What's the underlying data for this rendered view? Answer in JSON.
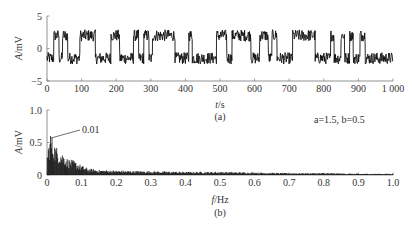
{
  "chart_data": [
    {
      "id": "a",
      "type": "line",
      "panel_label": "(a)",
      "title": "",
      "xlabel_var": "t",
      "xlabel_unit": "/s",
      "ylabel_var": "A",
      "ylabel_unit": "/mV",
      "xlim": [
        0,
        1000
      ],
      "ylim": [
        -5,
        5
      ],
      "xticks": [
        0,
        100,
        200,
        300,
        400,
        500,
        600,
        700,
        800,
        900,
        1000
      ],
      "xtick_labels": [
        "0",
        "100",
        "200",
        "300",
        "400",
        "500",
        "600",
        "700",
        "800",
        "900",
        "1 000"
      ],
      "yticks": [
        -5,
        0,
        5
      ],
      "ytick_labels": [
        "−5",
        "0",
        "5"
      ],
      "grid": false,
      "description": "Noisy two-state switching signal between about +2 mV and −1.5 mV",
      "high_level": 2.0,
      "low_level": -1.5,
      "state_segments": [
        {
          "start": 0,
          "end": 20,
          "level": "low"
        },
        {
          "start": 20,
          "end": 35,
          "level": "high"
        },
        {
          "start": 35,
          "end": 45,
          "level": "low"
        },
        {
          "start": 45,
          "end": 60,
          "level": "high"
        },
        {
          "start": 60,
          "end": 95,
          "level": "low"
        },
        {
          "start": 95,
          "end": 140,
          "level": "high"
        },
        {
          "start": 140,
          "end": 185,
          "level": "low"
        },
        {
          "start": 185,
          "end": 210,
          "level": "high"
        },
        {
          "start": 210,
          "end": 250,
          "level": "low"
        },
        {
          "start": 250,
          "end": 265,
          "level": "high"
        },
        {
          "start": 265,
          "end": 280,
          "level": "low"
        },
        {
          "start": 280,
          "end": 295,
          "level": "high"
        },
        {
          "start": 295,
          "end": 305,
          "level": "low"
        },
        {
          "start": 305,
          "end": 370,
          "level": "high"
        },
        {
          "start": 370,
          "end": 410,
          "level": "low"
        },
        {
          "start": 410,
          "end": 420,
          "level": "high"
        },
        {
          "start": 420,
          "end": 490,
          "level": "low"
        },
        {
          "start": 490,
          "end": 520,
          "level": "high"
        },
        {
          "start": 520,
          "end": 535,
          "level": "low"
        },
        {
          "start": 535,
          "end": 590,
          "level": "high"
        },
        {
          "start": 590,
          "end": 615,
          "level": "low"
        },
        {
          "start": 615,
          "end": 640,
          "level": "high"
        },
        {
          "start": 640,
          "end": 650,
          "level": "low"
        },
        {
          "start": 650,
          "end": 665,
          "level": "high"
        },
        {
          "start": 665,
          "end": 710,
          "level": "low"
        },
        {
          "start": 710,
          "end": 775,
          "level": "high"
        },
        {
          "start": 775,
          "end": 820,
          "level": "low"
        },
        {
          "start": 820,
          "end": 830,
          "level": "high"
        },
        {
          "start": 830,
          "end": 850,
          "level": "low"
        },
        {
          "start": 850,
          "end": 860,
          "level": "high"
        },
        {
          "start": 860,
          "end": 875,
          "level": "low"
        },
        {
          "start": 875,
          "end": 885,
          "level": "high"
        },
        {
          "start": 885,
          "end": 905,
          "level": "low"
        },
        {
          "start": 905,
          "end": 920,
          "level": "high"
        },
        {
          "start": 920,
          "end": 1000,
          "level": "low"
        }
      ]
    },
    {
      "id": "b",
      "type": "line",
      "panel_label": "(b)",
      "title": "",
      "xlabel_var": "f",
      "xlabel_unit": "/Hz",
      "ylabel_var": "A",
      "ylabel_unit": "/mV",
      "xlim": [
        0,
        1.0
      ],
      "ylim": [
        0,
        1.0
      ],
      "xticks": [
        0,
        0.1,
        0.2,
        0.3,
        0.4,
        0.5,
        0.6,
        0.7,
        0.8,
        0.9,
        1.0
      ],
      "xtick_labels": [
        "0",
        "0.1",
        "0.2",
        "0.3",
        "0.4",
        "0.5",
        "0.6",
        "0.7",
        "0.8",
        "0.9",
        "1.0"
      ],
      "yticks": [
        0,
        0.5,
        1.0
      ],
      "ytick_labels": [
        "0",
        "0.5",
        "1.0"
      ],
      "grid": false,
      "description": "Amplitude spectrum with peak at 0.01 Hz decaying to near zero by ~0.2 Hz",
      "annotation": {
        "text": "0.01",
        "x": 0.01,
        "y": 0.68
      },
      "parameter_text": "a=1.5, b=0.5",
      "envelope": {
        "x": [
          0.0,
          0.01,
          0.02,
          0.03,
          0.04,
          0.05,
          0.06,
          0.08,
          0.1,
          0.12,
          0.15,
          0.2,
          0.3,
          0.4,
          0.5,
          0.6,
          0.7,
          0.8,
          0.9,
          1.0
        ],
        "y": [
          0.3,
          0.68,
          0.5,
          0.42,
          0.38,
          0.32,
          0.25,
          0.22,
          0.15,
          0.1,
          0.08,
          0.07,
          0.06,
          0.05,
          0.05,
          0.04,
          0.03,
          0.03,
          0.02,
          0.02
        ]
      }
    }
  ],
  "labels": {
    "panel_a": "(a)",
    "panel_b": "(b)",
    "param": "a=1.5, b=0.5",
    "annot": "0.01"
  }
}
